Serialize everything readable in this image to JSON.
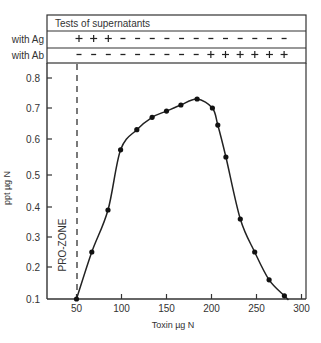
{
  "table": {
    "title": "Tests of supernatants",
    "rows": [
      {
        "label": "with Ag",
        "signs": [
          "+",
          "+",
          "+",
          "-",
          "-",
          "-",
          "-",
          "-",
          "-",
          "-",
          "-",
          "-",
          "-",
          "-",
          "-"
        ]
      },
      {
        "label": "with Ab",
        "signs": [
          "-",
          "-",
          "-",
          "-",
          "-",
          "-",
          "-",
          "-",
          "-",
          "+",
          "+",
          "+",
          "+",
          "+",
          "+"
        ]
      }
    ]
  },
  "annotation": {
    "prozone_label": "PRO-ZONE",
    "prozone_x": 50
  },
  "chart_data": {
    "type": "line",
    "title": "",
    "xlabel": "Toxin µg N",
    "ylabel": "ppt µg N",
    "xlim": [
      15,
      305
    ],
    "ylim": [
      0.1,
      0.85
    ],
    "x_ticks": [
      50,
      100,
      150,
      200,
      250,
      300
    ],
    "y_ticks": [
      0.1,
      0.2,
      0.3,
      0.4,
      0.5,
      0.6,
      0.7,
      0.8
    ],
    "grid": false,
    "legend": null,
    "series": [
      {
        "name": "precipitate",
        "markers": true,
        "smooth_curve": true,
        "x": [
          50,
          67,
          85,
          99,
          117,
          134,
          150,
          166,
          184,
          201,
          207,
          216,
          232,
          248,
          264,
          281
        ],
        "y": [
          0.1,
          0.25,
          0.39,
          0.57,
          0.63,
          0.67,
          0.69,
          0.71,
          0.73,
          0.7,
          0.645,
          0.55,
          0.36,
          0.25,
          0.16,
          0.11
        ]
      }
    ],
    "annotations": [
      {
        "type": "vertical-dashed-line",
        "x": 50,
        "label": "PRO-ZONE"
      }
    ]
  }
}
